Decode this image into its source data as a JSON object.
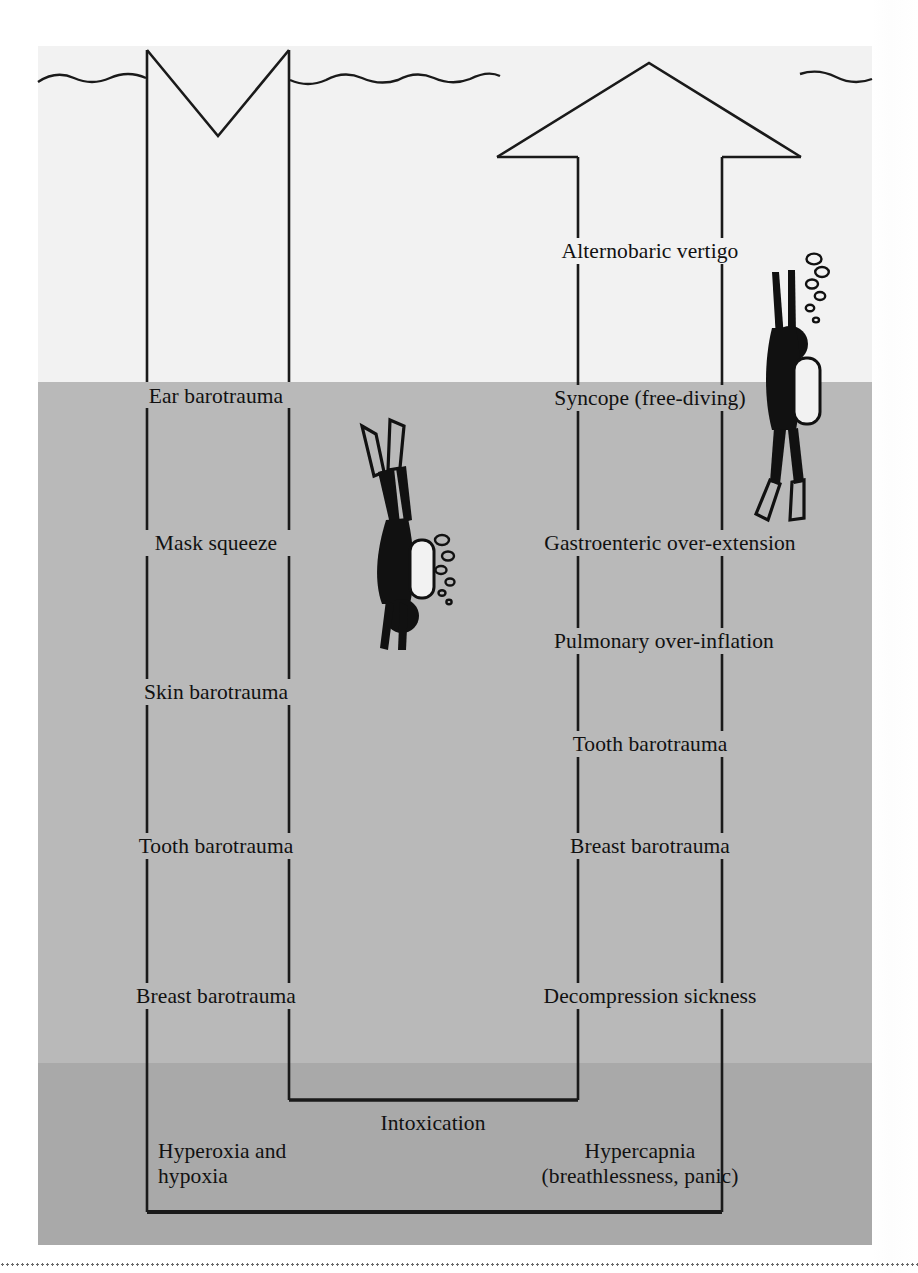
{
  "figure": {
    "kind": "diving-hazards-depth-diagram",
    "descent_arrow_caption": "descent",
    "ascent_arrow_caption": "ascent"
  },
  "descent": {
    "labels": [
      {
        "text": "Ear barotrauma",
        "x": 216,
        "y": 396
      },
      {
        "text": "Mask squeeze",
        "x": 216,
        "y": 543
      },
      {
        "text": "Skin barotrauma",
        "x": 216,
        "y": 692
      },
      {
        "text": "Tooth barotrauma",
        "x": 216,
        "y": 846
      },
      {
        "text": "Breast barotrauma",
        "x": 216,
        "y": 996
      }
    ]
  },
  "ascent": {
    "labels": [
      {
        "text": "Alternobaric vertigo",
        "x": 650,
        "y": 251
      },
      {
        "text": "Syncope (free-diving)",
        "x": 650,
        "y": 398
      },
      {
        "text": "Gastroenteric over-extension",
        "x": 670,
        "y": 543
      },
      {
        "text": "Pulmonary over-inflation",
        "x": 664,
        "y": 641
      },
      {
        "text": "Tooth barotrauma",
        "x": 650,
        "y": 744
      },
      {
        "text": "Breast barotrauma",
        "x": 650,
        "y": 846
      },
      {
        "text": "Decompression sickness",
        "x": 650,
        "y": 996
      }
    ]
  },
  "shared": {
    "intoxication": {
      "text": "Intoxication",
      "x": 433,
      "y": 1123
    },
    "hyperoxia": {
      "line1": "Hyperoxia and",
      "line2": "hypoxia",
      "x": 158,
      "y": 1164
    },
    "hypercapnia": {
      "line1": "Hypercapnia",
      "line2": "(breathlessness, panic)",
      "x": 640,
      "y": 1164
    }
  },
  "divers": [
    {
      "name": "descending-diver",
      "direction": "down",
      "x": 392,
      "y": 530
    },
    {
      "name": "ascending-diver",
      "direction": "up",
      "x": 782,
      "y": 390
    }
  ],
  "colors": {
    "water_shallow": "#f2f2f2",
    "water_mid": "#b9b9b9",
    "water_deep": "#a9a9a9",
    "ink": "#1a1a1a",
    "text": "#111111"
  },
  "geometry": {
    "descent_line_left_x": 145,
    "descent_line_right_x": 288,
    "ascent_line_left_x": 578,
    "ascent_line_right_x": 722,
    "surface_y": 78,
    "inner_bracket_bottom_y": 1100,
    "outer_bracket_bottom_y": 1212
  }
}
